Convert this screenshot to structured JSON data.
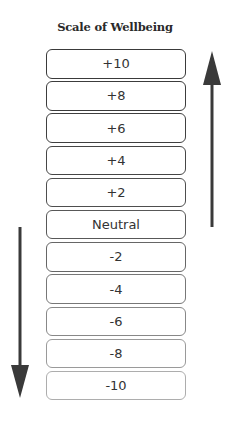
{
  "title": "Scale of Wellbeing",
  "scale": {
    "levels": [
      "+10",
      "+8",
      "+6",
      "+4",
      "+2",
      "Neutral",
      "-2",
      "-4",
      "-6",
      "-8",
      "-10"
    ],
    "border_colors": [
      "#3a3a3a",
      "#3c3c3c",
      "#404040",
      "#464646",
      "#4e4e4e",
      "#585858",
      "#666666",
      "#777777",
      "#888888",
      "#9a9a9a",
      "#adadad"
    ]
  },
  "arrows": {
    "up": {
      "direction": "up",
      "color": "#3a3a3a"
    },
    "down": {
      "direction": "down",
      "color": "#3a3a3a"
    }
  }
}
